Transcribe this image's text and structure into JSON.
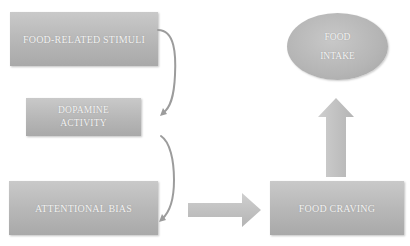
{
  "diagram": {
    "nodes": {
      "stimuli": {
        "lines": [
          "FOOD-RELATED STIMULI"
        ]
      },
      "dopamine": {
        "lines": [
          "DOPAMINE",
          "ACTIVITY"
        ]
      },
      "bias": {
        "lines": [
          "ATTENTIONAL BIAS"
        ]
      },
      "craving": {
        "lines": [
          "FOOD CRAVING"
        ]
      },
      "intake": {
        "lines": [
          "FOOD",
          "INTAKE"
        ]
      }
    },
    "edges": [
      {
        "from": "FOOD-RELATED STIMULI",
        "to": "DOPAMINE ACTIVITY",
        "style": "curved-arrow"
      },
      {
        "from": "DOPAMINE ACTIVITY",
        "to": "ATTENTIONAL BIAS",
        "style": "curved-arrow"
      },
      {
        "from": "ATTENTIONAL BIAS",
        "to": "FOOD CRAVING",
        "style": "block-arrow-right"
      },
      {
        "from": "FOOD CRAVING",
        "to": "FOOD INTAKE",
        "style": "block-arrow-up"
      }
    ],
    "colors": {
      "node_fill": "#b8b8b8",
      "node_text": "#f4f4f4",
      "arrow_fill": "#c4c4c4",
      "connector": "#999999"
    }
  }
}
